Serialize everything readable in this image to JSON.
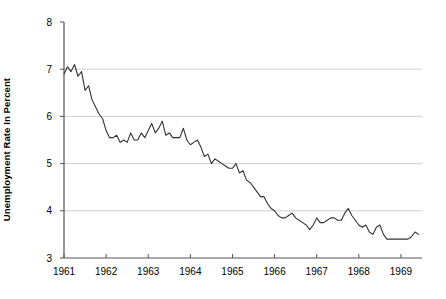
{
  "chart_data": {
    "type": "line",
    "title": "",
    "xlabel": "",
    "ylabel": "Unemployment Rate In Percent",
    "ylim": [
      3,
      8
    ],
    "xlim": [
      1961.0,
      1969.5
    ],
    "grid": "horizontal",
    "legend": "none",
    "y_ticks": [
      "3",
      "4",
      "5",
      "6",
      "7",
      "8"
    ],
    "y_tick_values": [
      3,
      4,
      5,
      6,
      7,
      8
    ],
    "x_ticks": [
      "1961",
      "1962",
      "1963",
      "1964",
      "1965",
      "1966",
      "1967",
      "1968",
      "1969"
    ],
    "x_tick_values": [
      1961,
      1962,
      1963,
      1964,
      1965,
      1966,
      1967,
      1968,
      1969
    ],
    "series": [
      {
        "name": "Unemployment Rate",
        "color": "#333333",
        "x": [
          1961.0,
          1961.083,
          1961.167,
          1961.25,
          1961.333,
          1961.417,
          1961.5,
          1961.583,
          1961.667,
          1961.75,
          1961.833,
          1961.917,
          1962.0,
          1962.083,
          1962.167,
          1962.25,
          1962.333,
          1962.417,
          1962.5,
          1962.583,
          1962.667,
          1962.75,
          1962.833,
          1962.917,
          1963.0,
          1963.083,
          1963.167,
          1963.25,
          1963.333,
          1963.417,
          1963.5,
          1963.583,
          1963.667,
          1963.75,
          1963.833,
          1963.917,
          1964.0,
          1964.083,
          1964.167,
          1964.25,
          1964.333,
          1964.417,
          1964.5,
          1964.583,
          1964.667,
          1964.75,
          1964.833,
          1964.917,
          1965.0,
          1965.083,
          1965.167,
          1965.25,
          1965.333,
          1965.417,
          1965.5,
          1965.583,
          1965.667,
          1965.75,
          1965.833,
          1965.917,
          1966.0,
          1966.083,
          1966.167,
          1966.25,
          1966.333,
          1966.417,
          1966.5,
          1966.583,
          1966.667,
          1966.75,
          1966.833,
          1966.917,
          1967.0,
          1967.083,
          1967.167,
          1967.25,
          1967.333,
          1967.417,
          1967.5,
          1967.583,
          1967.667,
          1967.75,
          1967.833,
          1967.917,
          1968.0,
          1968.083,
          1968.167,
          1968.25,
          1968.333,
          1968.417,
          1968.5,
          1968.583,
          1968.667,
          1968.75,
          1968.833,
          1968.917,
          1969.0,
          1969.083,
          1969.167,
          1969.25,
          1969.333,
          1969.417
        ],
        "values": [
          6.9,
          7.05,
          6.95,
          7.1,
          6.85,
          6.95,
          6.55,
          6.65,
          6.35,
          6.2,
          6.05,
          5.95,
          5.7,
          5.55,
          5.55,
          5.6,
          5.45,
          5.5,
          5.45,
          5.65,
          5.5,
          5.5,
          5.65,
          5.55,
          5.7,
          5.85,
          5.65,
          5.75,
          5.9,
          5.6,
          5.65,
          5.55,
          5.55,
          5.55,
          5.75,
          5.5,
          5.4,
          5.45,
          5.5,
          5.35,
          5.15,
          5.2,
          5.0,
          5.1,
          5.05,
          5.0,
          4.95,
          4.9,
          4.9,
          5.0,
          4.8,
          4.85,
          4.65,
          4.6,
          4.5,
          4.4,
          4.3,
          4.3,
          4.15,
          4.05,
          4.0,
          3.9,
          3.85,
          3.85,
          3.9,
          3.95,
          3.85,
          3.8,
          3.75,
          3.7,
          3.6,
          3.7,
          3.85,
          3.75,
          3.75,
          3.8,
          3.85,
          3.85,
          3.8,
          3.8,
          3.95,
          4.05,
          3.9,
          3.8,
          3.7,
          3.65,
          3.7,
          3.55,
          3.5,
          3.65,
          3.7,
          3.5,
          3.4,
          3.4,
          3.4,
          3.4,
          3.4,
          3.4,
          3.4,
          3.45,
          3.55,
          3.5
        ]
      }
    ]
  },
  "axis": {
    "ylabel_text": "Unemployment Rate In Percent"
  }
}
